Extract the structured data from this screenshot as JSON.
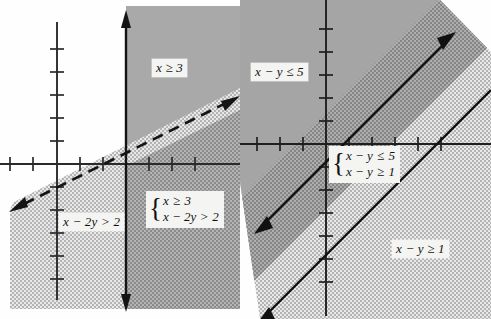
{
  "figure": {
    "type": "math-inequality-graphs",
    "panel_count": 2,
    "caption": ""
  },
  "panels": [
    {
      "id": "left",
      "name": "graph-x-ge-3-and-x-minus-2y-gt-2",
      "axes": {
        "x_axis_y_px": 164,
        "y_axis_x_px": 57,
        "tick_spacing_px": 23,
        "x_ticks": [
          -2,
          -1,
          1,
          2,
          3,
          4,
          5,
          6
        ],
        "y_ticks": [
          -5,
          -4,
          -3,
          -2,
          -1,
          1,
          2,
          3,
          4,
          5,
          6
        ]
      },
      "labels": {
        "region_dark": "x ≥ 3",
        "region_light": "x − 2y > 2",
        "system_line1_lhs": "x",
        "system_line1_op": "≥",
        "system_line1_rhs": "3",
        "system_line2_lhs": "x − 2y",
        "system_line2_op": ">",
        "system_line2_rhs": "2"
      },
      "boundaries": [
        {
          "name": "vertical-solid-line",
          "equation": "x = 3",
          "style": "solid",
          "arrows": "both"
        },
        {
          "name": "diagonal-dashed-line",
          "equation": "x − 2y = 2",
          "slope": 0.5,
          "style": "dashed",
          "arrows": "both"
        }
      ],
      "colors": {
        "dark_shade": "#a8a8a8",
        "light_shade": "#dcdcdc",
        "line": "#1a1a1a",
        "axis": "#2a2a2a"
      }
    },
    {
      "id": "right",
      "name": "graph-x-minus-y-le-5-and-x-minus-y-ge-1",
      "axes": {
        "x_axis_y_px": 144,
        "y_axis_x_px": 86,
        "tick_spacing_px": 23,
        "x_ticks": [
          -3,
          -2,
          -1,
          1,
          2,
          3,
          4,
          5
        ],
        "y_ticks": [
          -5,
          -4,
          -3,
          -2,
          -1,
          1,
          2,
          3,
          4,
          5
        ]
      },
      "labels": {
        "region_upper": "x − y ≤ 5",
        "region_lower": "x − y ≥ 1",
        "system_line1_lhs": "x − y",
        "system_line1_op": "≤",
        "system_line1_rhs": "5",
        "system_line2_lhs": "x − y",
        "system_line2_op": "≥",
        "system_line2_rhs": "1"
      },
      "boundaries": [
        {
          "name": "upper-solid-line",
          "equation": "x − y = 1",
          "slope": 1,
          "style": "solid",
          "arrows": "both"
        },
        {
          "name": "lower-solid-line",
          "equation": "x − y = 5",
          "slope": 1,
          "style": "solid",
          "arrows": "both"
        }
      ],
      "colors": {
        "dark_shade": "#9e9e9e",
        "mid_shade": "#8f8f8f",
        "light_shade": "#dcdcdc",
        "line": "#111111",
        "axis": "#1f1f1f"
      }
    }
  ]
}
